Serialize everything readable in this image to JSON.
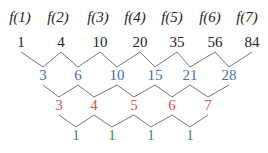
{
  "colors": {
    "top": "#222222",
    "diff1": "#4a6fa5",
    "diff2": "#e05050",
    "diff3": "#3f8a55",
    "line": "#777777"
  },
  "rows": [
    {
      "name": "function-labels",
      "y": 22,
      "items": [
        {
          "text": "f(1)",
          "x": 20
        },
        {
          "text": "f(2)",
          "x": 58
        },
        {
          "text": "f(3)",
          "x": 98
        },
        {
          "text": "f(4)",
          "x": 135
        },
        {
          "text": "f(5)",
          "x": 172
        },
        {
          "text": "f(6)",
          "x": 210
        },
        {
          "text": "f(7)",
          "x": 247
        }
      ]
    },
    {
      "name": "values",
      "y": 47,
      "items": [
        {
          "text": "1",
          "x": 21
        },
        {
          "text": "4",
          "x": 61
        },
        {
          "text": "10",
          "x": 100
        },
        {
          "text": "20",
          "x": 140
        },
        {
          "text": "35",
          "x": 177
        },
        {
          "text": "56",
          "x": 215
        },
        {
          "text": "84",
          "x": 252
        }
      ]
    },
    {
      "name": "first-differences",
      "y": 80,
      "items": [
        {
          "text": "3",
          "x": 43
        },
        {
          "text": "6",
          "x": 78
        },
        {
          "text": "10",
          "x": 117
        },
        {
          "text": "15",
          "x": 155
        },
        {
          "text": "21",
          "x": 190
        },
        {
          "text": "28",
          "x": 229
        }
      ]
    },
    {
      "name": "second-differences",
      "y": 110,
      "items": [
        {
          "text": "3",
          "x": 59
        },
        {
          "text": "4",
          "x": 94
        },
        {
          "text": "5",
          "x": 134
        },
        {
          "text": "6",
          "x": 172
        },
        {
          "text": "7",
          "x": 208
        }
      ]
    },
    {
      "name": "third-differences",
      "y": 140,
      "items": [
        {
          "text": "1",
          "x": 76
        },
        {
          "text": "1",
          "x": 112
        },
        {
          "text": "1",
          "x": 151
        },
        {
          "text": "1",
          "x": 190
        }
      ]
    }
  ]
}
